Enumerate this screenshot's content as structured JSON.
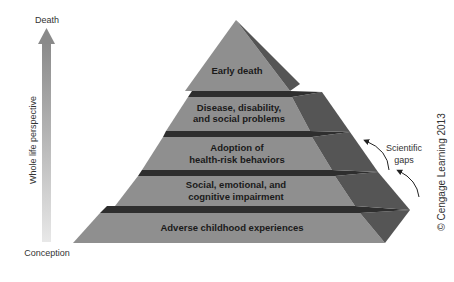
{
  "axis": {
    "top_label": "Death",
    "bottom_label": "Conception",
    "arrow_label": "Whole life perspective"
  },
  "pyramid": {
    "tiers": [
      {
        "lines": [
          "Early death"
        ]
      },
      {
        "lines": [
          "Disease, disability,",
          "and social problems"
        ]
      },
      {
        "lines": [
          "Adoption of",
          "health-risk behaviors"
        ]
      },
      {
        "lines": [
          "Social, emotional, and",
          "cognitive impairment"
        ]
      },
      {
        "lines": [
          "Adverse childhood experiences"
        ]
      }
    ],
    "colors": {
      "front": "#8f8f8f",
      "side": "#555555",
      "gap_top": "#3a3a3a",
      "gap_side": "#222222"
    }
  },
  "annotation": {
    "line1": "Scientific",
    "line2": "gaps"
  },
  "copyright": "© Cengage Learning 2013"
}
